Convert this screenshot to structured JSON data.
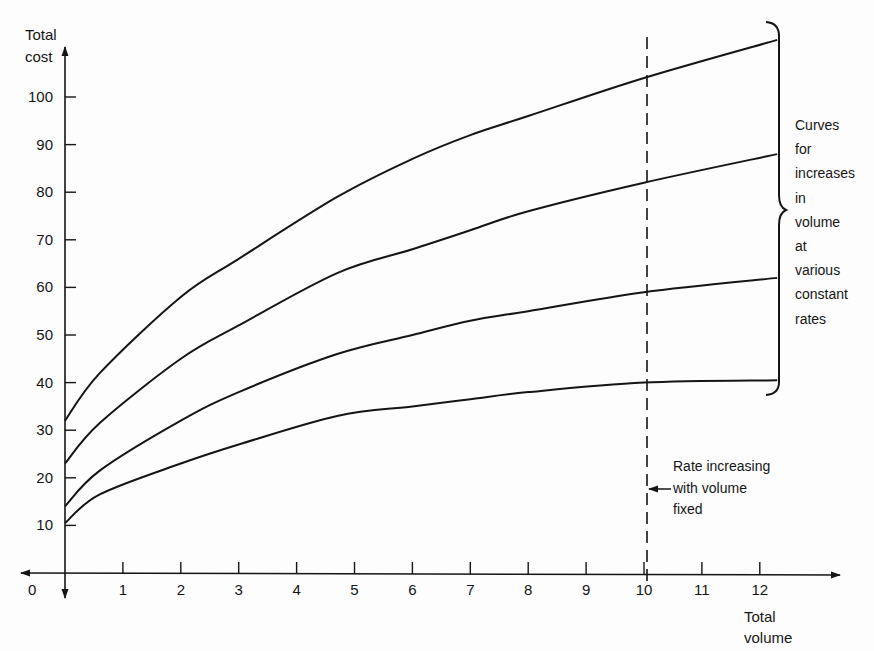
{
  "chart_data": {
    "type": "line",
    "title": "",
    "xlabel": "Total volume",
    "ylabel": "Total cost",
    "xlim": [
      0,
      12.3
    ],
    "ylim": [
      0,
      110
    ],
    "grid": false,
    "x_ticks": [
      "0",
      "1",
      "2",
      "3",
      "4",
      "5",
      "6",
      "7",
      "8",
      "9",
      "10",
      "11",
      "12"
    ],
    "y_ticks": [
      "10",
      "20",
      "30",
      "40",
      "50",
      "60",
      "70",
      "80",
      "90",
      "100"
    ],
    "series": [
      {
        "name": "Constant rate curve 1 (highest)",
        "x": [
          0,
          0.6,
          2,
          3,
          4.7,
          6,
          7,
          8,
          10,
          12.3
        ],
        "values": [
          32,
          42,
          58,
          66,
          79,
          87,
          92,
          96,
          104,
          112
        ]
      },
      {
        "name": "Constant rate curve 2",
        "x": [
          0,
          0.6,
          2,
          3,
          4.7,
          6,
          7,
          8,
          10,
          12.3
        ],
        "values": [
          23,
          31.5,
          45,
          52,
          63,
          68,
          72,
          76,
          82,
          88
        ]
      },
      {
        "name": "Constant rate curve 3",
        "x": [
          0,
          0.6,
          2,
          3,
          4.7,
          6,
          7,
          8,
          10,
          12.3
        ],
        "values": [
          14,
          21.5,
          32,
          38,
          46,
          50,
          53,
          55,
          59,
          62
        ]
      },
      {
        "name": "Constant rate curve 4 (lowest)",
        "x": [
          0,
          0.6,
          2,
          3,
          4.7,
          6,
          7,
          8,
          10,
          12.3
        ],
        "values": [
          10.5,
          16.5,
          23,
          27,
          33,
          35,
          36.5,
          38,
          40,
          40.5
        ]
      }
    ],
    "reference_lines": [
      {
        "type": "vertical",
        "x": 10,
        "style": "dashed"
      }
    ],
    "annotations": [
      {
        "text": "Curves for increases in volume at various constant rates",
        "target": "all curves (brace)"
      },
      {
        "text": "Rate increasing with volume fixed",
        "target": "dashed line at volume 10"
      }
    ]
  },
  "axes": {
    "y_label_line1": "Total",
    "y_label_line2": "cost",
    "x_label_line1": "Total",
    "x_label_line2": "volume",
    "origin_label": "0"
  },
  "annotations": {
    "brace_note": [
      "Curves",
      "for",
      "increases",
      "in",
      "volume",
      "at",
      "various",
      "constant",
      "rates"
    ],
    "dashed_note": [
      "Rate increasing",
      "with volume",
      "fixed"
    ]
  }
}
